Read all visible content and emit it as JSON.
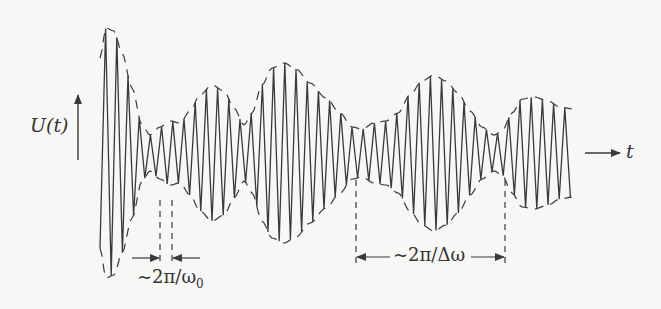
{
  "figure": {
    "y_axis_label": "U(t)",
    "x_axis_label": "t",
    "carrier_period_label": "~2π/ω0",
    "carrier_period_label_main": "~2π/ω",
    "carrier_period_label_sub": "0",
    "envelope_period_label": "~2π/Δω"
  },
  "colors": {
    "line": "#3a3a3a",
    "background": "#f7f7f5"
  },
  "signal": {
    "baseline_y": 153,
    "x_start": 100,
    "x_end": 573,
    "carrier_period_px": 11.2,
    "envelope_points": [
      [
        100,
        95
      ],
      [
        106,
        125
      ],
      [
        114,
        122
      ],
      [
        122,
        100
      ],
      [
        132,
        65
      ],
      [
        142,
        28
      ],
      [
        150,
        18
      ],
      [
        160,
        26
      ],
      [
        170,
        32
      ],
      [
        180,
        30
      ],
      [
        190,
        42
      ],
      [
        200,
        58
      ],
      [
        212,
        68
      ],
      [
        224,
        62
      ],
      [
        234,
        45
      ],
      [
        244,
        28
      ],
      [
        252,
        40
      ],
      [
        262,
        68
      ],
      [
        272,
        85
      ],
      [
        284,
        90
      ],
      [
        296,
        84
      ],
      [
        310,
        70
      ],
      [
        326,
        55
      ],
      [
        340,
        40
      ],
      [
        352,
        26
      ],
      [
        362,
        24
      ],
      [
        374,
        30
      ],
      [
        386,
        32
      ],
      [
        398,
        40
      ],
      [
        410,
        58
      ],
      [
        422,
        72
      ],
      [
        434,
        78
      ],
      [
        446,
        72
      ],
      [
        458,
        60
      ],
      [
        470,
        42
      ],
      [
        482,
        26
      ],
      [
        494,
        18
      ],
      [
        502,
        22
      ],
      [
        512,
        40
      ],
      [
        522,
        54
      ],
      [
        534,
        56
      ],
      [
        548,
        52
      ],
      [
        560,
        46
      ],
      [
        573,
        44
      ]
    ]
  },
  "markers": {
    "omega0": {
      "x1": 160,
      "x2": 172,
      "y_top": 200,
      "y_bottom": 262,
      "arrow_y": 258
    },
    "delta_omega": {
      "x1": 356,
      "x2": 505,
      "y_top": 180,
      "y_bottom": 265,
      "arrow_y": 257
    }
  },
  "axes": {
    "y_arrow": {
      "x": 78,
      "y1": 160,
      "y2": 95
    },
    "t_arrow": {
      "x1": 585,
      "x2": 620,
      "y": 153
    }
  }
}
